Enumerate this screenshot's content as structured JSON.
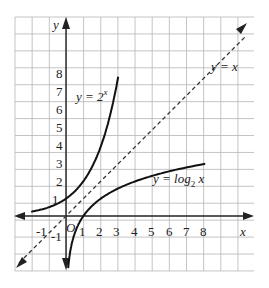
{
  "chart_data": {
    "type": "line",
    "title": "",
    "xlabel": "x",
    "ylabel": "y",
    "origin_label": "O",
    "x_ticks": [
      "-1",
      "1",
      "2",
      "3",
      "4",
      "5",
      "6",
      "7",
      "8"
    ],
    "y_ticks": [
      "-1",
      "1",
      "2",
      "3",
      "4",
      "5",
      "6",
      "7",
      "8"
    ],
    "xlim": [
      -3,
      10.7
    ],
    "ylim": [
      -3,
      11.5
    ],
    "grid": true,
    "series": [
      {
        "name": "y = 2^x",
        "label_main": "y = 2",
        "label_sup": "x",
        "style": "solid",
        "points": [
          [
            -2,
            0.25
          ],
          [
            -1,
            0.5
          ],
          [
            0,
            1
          ],
          [
            1,
            2
          ],
          [
            2,
            4
          ],
          [
            2.5,
            5.66
          ],
          [
            3,
            8
          ]
        ]
      },
      {
        "name": "y = log2 x",
        "label_main": "y = log",
        "label_sub": "2",
        "label_tail": " x",
        "style": "solid",
        "points": [
          [
            0.125,
            -3
          ],
          [
            0.25,
            -2
          ],
          [
            0.5,
            -1
          ],
          [
            1,
            0
          ],
          [
            2,
            1
          ],
          [
            4,
            2
          ],
          [
            8,
            3
          ]
        ]
      },
      {
        "name": "y = x",
        "label": "y = x",
        "style": "dashed",
        "points": [
          [
            -3,
            -3
          ],
          [
            10.7,
            10.7
          ]
        ]
      }
    ]
  }
}
